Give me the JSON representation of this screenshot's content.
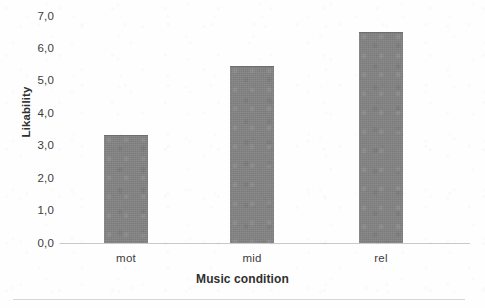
{
  "chart_data": {
    "type": "bar",
    "title": "",
    "subtitle": "",
    "categories": [
      "mot",
      "mid",
      "rel"
    ],
    "values": [
      3.3,
      5.4,
      6.45
    ],
    "series": [
      {
        "name": "Likability",
        "values": [
          3.3,
          5.4,
          6.45
        ]
      }
    ],
    "xlabel": "Music condition",
    "ylabel": "Likability",
    "ylim": [
      0.0,
      7.0
    ],
    "ytick_values": [
      7.0,
      6.0,
      5.0,
      4.0,
      3.0,
      2.0,
      1.0,
      0.0
    ],
    "ytick_labels": [
      "7,0",
      "6,0",
      "5,0",
      "4,0",
      "3,0",
      "2,0",
      "1,0",
      "0,0"
    ],
    "decimal_separator": ",",
    "grid": false,
    "legend": false,
    "legend_position": "none",
    "bar_color": "#828282",
    "axis_color": "#c9c9c9",
    "text_color": "#3c3c3c",
    "background_color": "#ffffff",
    "annotations": []
  },
  "axes": {
    "y_title": "Likability",
    "x_title": "Music condition",
    "ticks": [
      {
        "label": "7,0",
        "value": 7.0
      },
      {
        "label": "6,0",
        "value": 6.0
      },
      {
        "label": "5,0",
        "value": 5.0
      },
      {
        "label": "4,0",
        "value": 4.0
      },
      {
        "label": "3,0",
        "value": 3.0
      },
      {
        "label": "2,0",
        "value": 2.0
      },
      {
        "label": "1,0",
        "value": 1.0
      },
      {
        "label": "0,0",
        "value": 0.0
      }
    ]
  },
  "bars": [
    {
      "category": "mot",
      "value": 3.3
    },
    {
      "category": "mid",
      "value": 5.4
    },
    {
      "category": "rel",
      "value": 6.45
    }
  ]
}
